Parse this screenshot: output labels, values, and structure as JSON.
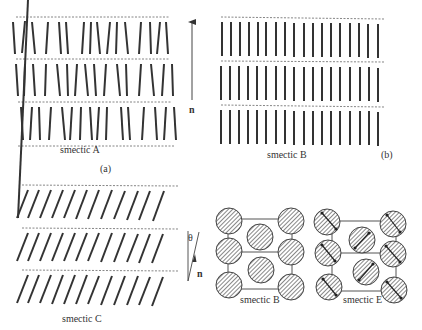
{
  "panels": {
    "a": {
      "title": "smectic A",
      "tag": "(a)",
      "director_label": "n"
    },
    "b": {
      "title": "smectic B",
      "tag": "(b)"
    },
    "c": {
      "title": "smectic C",
      "tilt_label": "θ",
      "director_label": "n"
    },
    "b_top_view": {
      "title": "smectic B"
    },
    "e_top_view": {
      "title": "smectic E"
    }
  },
  "colors": {
    "rod": "#333333",
    "layer_line": "#555555",
    "hatch": "#555555",
    "frame": "#555555"
  }
}
